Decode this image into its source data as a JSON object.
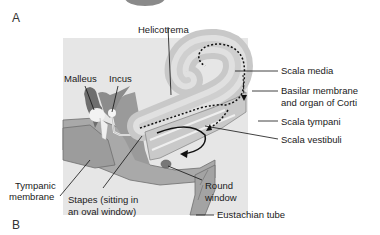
{
  "panels": {
    "a": "A",
    "b": "B"
  },
  "labels": {
    "helicotrema": "Helicotrema",
    "malleus": "Malleus",
    "incus": "Incus",
    "scala_media": "Scala media",
    "basilar_line1": "Basilar membrane",
    "basilar_line2": "and organ of Corti",
    "scala_tympani": "Scala tympani",
    "scala_vestibuli": "Scala vestibuli",
    "tympanic_line1": "Tympanic",
    "tympanic_line2": "membrane",
    "stapes_line1": "Stapes (sitting in",
    "stapes_line2": "an oval window)",
    "round_line1": "Round",
    "round_line2": "window",
    "eustachian": "Eustachian tube"
  },
  "colors": {
    "background": "#ffffff",
    "panel_bg": "#e6e6e6",
    "tissue": "#a9a9a9",
    "tissue_dark": "#7d7d7d",
    "cochlea_fill": "#c8c8c8",
    "cochlea_inner": "#d9d9d9",
    "bone_light": "#f2f2f2",
    "line": "#111111"
  }
}
